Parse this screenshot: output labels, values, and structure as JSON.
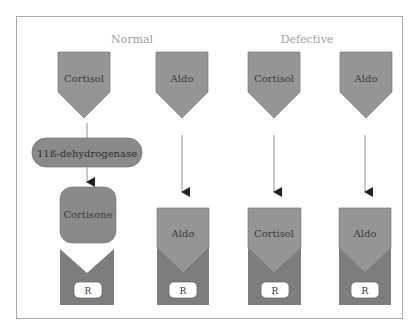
{
  "diagram": {
    "title_normal": "Normal",
    "title_defective": "Defective",
    "enzyme": "11ß-dehydrogenase",
    "colors": {
      "hormone_fill": "#959595",
      "receptor_fill": "#7d7d7d",
      "enzyme_fill": "#8a8a8a",
      "label_text": "#3a3a3a",
      "heading_text": "#a0a0a0",
      "line": "#777777",
      "frame": "#a8a8a8"
    },
    "columns": [
      {
        "group": "Normal",
        "hormone": "Cortisol",
        "converted_to": "Cortisone",
        "receptor_bound": "",
        "receptor_label": "R"
      },
      {
        "group": "Normal",
        "hormone": "Aldo",
        "converted_to": "",
        "receptor_bound": "Aldo",
        "receptor_label": "R"
      },
      {
        "group": "Defective",
        "hormone": "Cortisol",
        "converted_to": "",
        "receptor_bound": "Cortisol",
        "receptor_label": "R"
      },
      {
        "group": "Defective",
        "hormone": "Aldo",
        "converted_to": "",
        "receptor_bound": "Aldo",
        "receptor_label": "R"
      }
    ]
  }
}
